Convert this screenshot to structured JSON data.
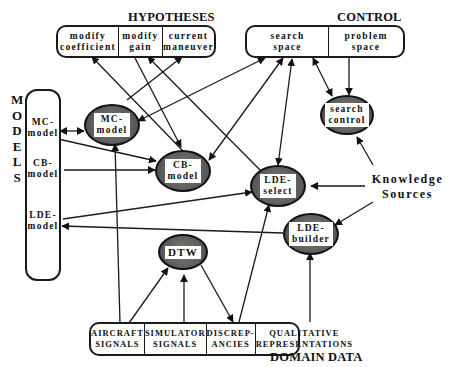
{
  "hypotheses": {
    "title": "HYPOTHESES",
    "cells": [
      {
        "line1": "modify",
        "line2": "coefficient"
      },
      {
        "line1": "modify",
        "line2": "gain"
      },
      {
        "line1": "current",
        "line2": "maneuver"
      }
    ]
  },
  "control": {
    "title": "CONTROL",
    "cells": [
      {
        "line1": "search",
        "line2": "space"
      },
      {
        "line1": "problem",
        "line2": "space"
      }
    ]
  },
  "models": {
    "title_letters": [
      "M",
      "O",
      "D",
      "E",
      "L",
      "S"
    ],
    "items": [
      {
        "line1": "MC-",
        "line2": "model"
      },
      {
        "line1": "CB-",
        "line2": "model"
      },
      {
        "line1": "LDE-",
        "line2": "model"
      }
    ]
  },
  "knowledge_sources": {
    "label_line1": "Knowledge",
    "label_line2": "Sources",
    "nodes": {
      "mc_model": {
        "line1": "MC-",
        "line2": "model"
      },
      "cb_model": {
        "line1": "CB-",
        "line2": "model"
      },
      "lde_select": {
        "line1": "LDE-",
        "line2": "select"
      },
      "lde_builder": {
        "line1": "LDE-",
        "line2": "builder"
      },
      "search_control": {
        "line1": "search",
        "line2": "control"
      },
      "dtw": {
        "line1": "DTW"
      }
    }
  },
  "domain_data": {
    "title": "DOMAIN DATA",
    "cells": [
      {
        "line1": "AIRCRAFT",
        "line2": "SIGNALS"
      },
      {
        "line1": "SIMULATOR",
        "line2": "SIGNALS"
      },
      {
        "line1": "DISCREP-",
        "line2": "ANCIES"
      },
      {
        "line1": "QUALITATIVE",
        "line2": "REPRESENTATIONS"
      }
    ]
  },
  "colors": {
    "node_fill": "#5f5f5f",
    "line": "#1a1a1a",
    "background": "#ffffff"
  }
}
